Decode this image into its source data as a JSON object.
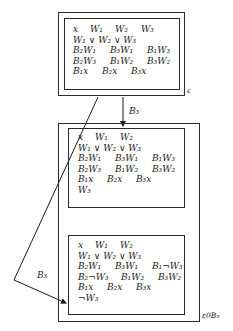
{
  "diagram": {
    "top_state": {
      "label": "ε",
      "rows": [
        [
          "x",
          "W₁",
          "W₂",
          "W₃"
        ],
        [
          "W₁ ∨ W₂ ∨ W₃"
        ],
        [
          "B₂W₁",
          "B₃W₁",
          "B₁W₃"
        ],
        [
          "B₂W₃",
          "B₁W₂",
          "B₃W₂"
        ],
        [
          "B₁x",
          "B₂x",
          "B₃x"
        ]
      ]
    },
    "arrow_down": {
      "label": "B₃"
    },
    "arrow_diagonal": {
      "label": "B₃"
    },
    "bottom_state": {
      "label": "ε0B₃",
      "world_1": {
        "rows": [
          [
            "x",
            "W₁",
            "W₂"
          ],
          [
            "W₁ ∨ W₂ ∨ W₃"
          ],
          [
            "B₂W₁",
            "B₃W₁",
            "B₁W₃"
          ],
          [
            "B₂W₃",
            "B₁W₂",
            "B₃W₂"
          ],
          [
            "B₁x",
            "B₂x",
            "B₃x"
          ],
          [
            "W₃"
          ]
        ]
      },
      "world_2": {
        "rows": [
          [
            "x",
            "W₁",
            "W₂"
          ],
          [
            "W₁ ∨ W₂ ∨ W₃"
          ],
          [
            "B₂W₁",
            "B₃W₁",
            "B₁¬W₃"
          ],
          [
            "B₂¬W₃",
            "B₁W₂",
            "B₃W₂"
          ],
          [
            "B₁x",
            "B₂x",
            "B₃x"
          ],
          [
            "¬W₃"
          ]
        ]
      }
    }
  }
}
